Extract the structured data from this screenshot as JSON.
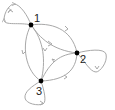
{
  "diagram": {
    "type": "directed-graph",
    "colors": {
      "edge": "#a8a8a8",
      "node": "#000000",
      "label": "#222222"
    },
    "nodes": [
      {
        "id": "1",
        "label": "1",
        "x": 31,
        "y": 25
      },
      {
        "id": "2",
        "label": "2",
        "x": 77,
        "y": 53
      },
      {
        "id": "3",
        "label": "3",
        "x": 41,
        "y": 81
      }
    ],
    "edges": [
      {
        "from": "1",
        "to": "1",
        "kind": "self-loop"
      },
      {
        "from": "2",
        "to": "2",
        "kind": "self-loop"
      },
      {
        "from": "3",
        "to": "3",
        "kind": "self-loop"
      },
      {
        "from": "1",
        "to": "2",
        "kind": "outer-arc"
      },
      {
        "from": "2",
        "to": "3",
        "kind": "outer-arc"
      },
      {
        "from": "3",
        "to": "1",
        "kind": "outer-arc"
      },
      {
        "from": "1",
        "to": "2",
        "kind": "inner-arc"
      },
      {
        "from": "2",
        "to": "3",
        "kind": "inner-arc"
      },
      {
        "from": "3",
        "to": "1",
        "kind": "inner-arc"
      }
    ]
  }
}
